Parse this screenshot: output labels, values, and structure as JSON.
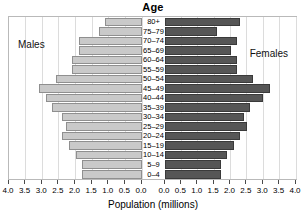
{
  "chart_data": {
    "type": "bar",
    "subtype": "population-pyramid",
    "title": "Age",
    "xlabel": "Population (millions)",
    "ylabel": "Age",
    "grid": true,
    "legend_position": "in-plot",
    "categories": [
      "80+",
      "75–79",
      "70–74",
      "65–69",
      "60–64",
      "55–59",
      "50–54",
      "45–49",
      "40–44",
      "35–39",
      "30–34",
      "25–29",
      "20–24",
      "15–19",
      "10–14",
      "5–9",
      "0–4"
    ],
    "series": [
      {
        "name": "Males",
        "color": "#c9c9c9",
        "axis": "left",
        "axis_direction": "reversed",
        "xlim": [
          0.0,
          4.0
        ],
        "values": [
          1.1,
          1.3,
          1.9,
          1.9,
          2.1,
          2.1,
          2.6,
          3.1,
          2.9,
          2.7,
          2.4,
          2.3,
          2.4,
          2.2,
          2.0,
          1.8,
          1.8
        ]
      },
      {
        "name": "Females",
        "color": "#565656",
        "axis": "right",
        "axis_direction": "normal",
        "xlim": [
          0.0,
          4.0
        ],
        "values": [
          2.3,
          1.6,
          2.2,
          2.0,
          2.2,
          2.2,
          2.7,
          3.2,
          3.0,
          2.6,
          2.4,
          2.5,
          2.3,
          2.1,
          1.9,
          1.7,
          1.7
        ]
      }
    ],
    "axes": {
      "left": {
        "ticks": [
          4.0,
          3.5,
          3.0,
          2.5,
          2.0,
          1.5,
          1.0,
          0.5,
          0.0
        ],
        "labels": [
          "4.0",
          "3.5",
          "3.0",
          "2.5",
          "2.0",
          "1.5",
          "1.0",
          "0.5",
          "0.0"
        ]
      },
      "right": {
        "ticks": [
          0.0,
          0.5,
          1.0,
          1.5,
          2.0,
          2.5,
          3.0,
          3.5,
          4.0
        ],
        "labels": [
          "0.0",
          "0.5",
          "1.0",
          "1.5",
          "2.0",
          "2.5",
          "3.0",
          "3.5",
          "4.0"
        ]
      }
    }
  }
}
